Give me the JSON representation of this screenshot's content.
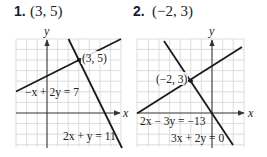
{
  "problems": [
    {
      "number": "1.",
      "answer": "(3, 5)",
      "graph": {
        "x_axis_label": "x",
        "y_axis_label": "y",
        "intersection_label": "(3, 5)",
        "equations": [
          "−x + 2y = 7",
          "2x + y = 11"
        ]
      }
    },
    {
      "number": "2.",
      "answer": "(−2, 3)",
      "graph": {
        "x_axis_label": "x",
        "y_axis_label": "y",
        "intersection_label": "(−2, 3)",
        "equations": [
          "2x − 3y = −13",
          "3x + 2y = 0"
        ]
      }
    }
  ],
  "colors": {
    "grid": "#d4d4d4",
    "axis": "#333333",
    "line": "#1a1a1a",
    "text": "#222222"
  }
}
